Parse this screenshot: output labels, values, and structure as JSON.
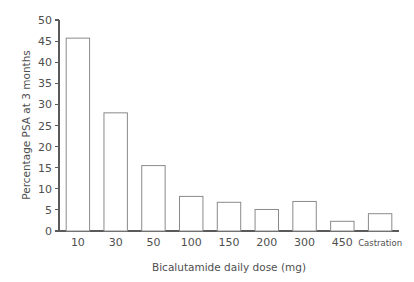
{
  "chart_data": {
    "type": "bar",
    "title": "",
    "xlabel": "Bicalutamide daily dose (mg)",
    "ylabel": "Percentage PSA at 3 months",
    "categories": [
      "10",
      "30",
      "50",
      "100",
      "150",
      "200",
      "300",
      "450",
      "Castration"
    ],
    "values": [
      45.7,
      28.0,
      15.5,
      8.2,
      6.8,
      5.1,
      7.0,
      2.3,
      4.1
    ],
    "ylim": [
      0,
      50
    ],
    "ytick_step": 5,
    "ytick_labels": [
      "0",
      "5",
      "10",
      "15",
      "20",
      "25",
      "30",
      "35",
      "40",
      "45",
      "50"
    ],
    "grid": false,
    "legend": false,
    "legend_position": "none",
    "bar_fill_color": "#ffffff",
    "bar_edge_color": "#8a8a8a",
    "axis_color": "#5a5a5a",
    "text_color": "#4f4f4f",
    "background_color": "#ffffff",
    "last_category_small_font": true
  }
}
